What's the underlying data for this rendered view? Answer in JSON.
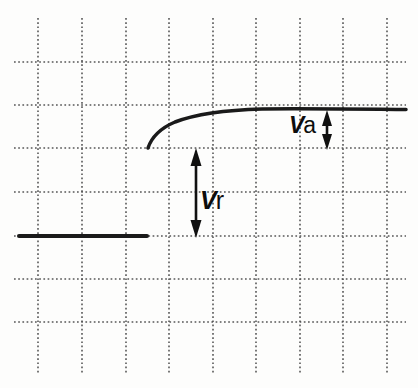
{
  "figure": {
    "kind": "waveform-diagram",
    "background_color": "#fdfdfc",
    "width": 418,
    "height": 388
  },
  "grid": {
    "style": "dotted",
    "color": "#4a4a4a",
    "vertical_x": [
      38,
      82,
      126,
      169,
      213,
      256,
      300,
      343,
      387
    ],
    "horizontal_y": [
      62,
      105,
      148,
      192,
      236,
      279,
      322
    ],
    "v_extent": [
      18,
      374
    ],
    "h_extent": [
      14,
      406
    ]
  },
  "trace": {
    "color": "#1a1a1a",
    "baseline": {
      "name": "low-level-segment",
      "x_start": 19,
      "x_end": 147,
      "y": 236,
      "stroke_width": 4.1
    },
    "curve": {
      "name": "rising-exponential-curve",
      "x_start": 148,
      "y_start": 148,
      "x_end": 406,
      "y_end": 112,
      "stroke_width": 3.5,
      "shape": "exponential-approach-to-asymptote"
    }
  },
  "dimensions": [
    {
      "id": "vr",
      "label_symbol": "V",
      "label_subscript": "r",
      "label_text": "Vr",
      "arrow_x": 196,
      "y_top": 150,
      "y_bottom": 236,
      "label_x": 200,
      "label_y": 188,
      "meaning": "reference-level-step"
    },
    {
      "id": "va",
      "label_symbol": "V",
      "label_subscript": "a",
      "label_text": "Va",
      "arrow_x": 327,
      "y_top": 112,
      "y_bottom": 148,
      "label_x": 289,
      "label_y": 114,
      "meaning": "asymptotic-overshoot-amplitude"
    }
  ]
}
